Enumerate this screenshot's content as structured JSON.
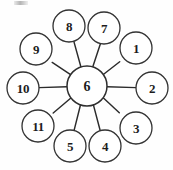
{
  "diagram": {
    "type": "wheel-graph",
    "title": "",
    "canvas": {
      "width": 173,
      "height": 170,
      "background": "#fefefe"
    },
    "colors": {
      "stroke": "#333333",
      "hub_stroke": "#2e2e2e",
      "spoke": "#2b2b2b",
      "node_fill": "#ffffff",
      "label": "#1d1d1d"
    },
    "hub": {
      "label": "6",
      "cx": 87,
      "cy": 86,
      "r": 20
    },
    "ring": {
      "radius": 58,
      "node_radius": 16,
      "count": 11
    },
    "nodes": [
      {
        "label": "1",
        "cx": 136,
        "cy": 48,
        "r": 16
      },
      {
        "label": "2",
        "cx": 152,
        "cy": 88,
        "r": 16
      },
      {
        "label": "3",
        "cx": 136,
        "cy": 128,
        "r": 16
      },
      {
        "label": "4",
        "cx": 105,
        "cy": 146,
        "r": 16
      },
      {
        "label": "5",
        "cx": 70,
        "cy": 146,
        "r": 16
      },
      {
        "label": "7",
        "cx": 104,
        "cy": 28,
        "r": 16
      },
      {
        "label": "8",
        "cx": 69,
        "cy": 26,
        "r": 16
      },
      {
        "label": "9",
        "cx": 36,
        "cy": 49,
        "r": 16
      },
      {
        "label": "10",
        "cx": 23,
        "cy": 88,
        "r": 16
      },
      {
        "label": "11",
        "cx": 38,
        "cy": 126,
        "r": 16
      }
    ],
    "edges": [
      {
        "from": "6",
        "to": "1"
      },
      {
        "from": "6",
        "to": "2"
      },
      {
        "from": "6",
        "to": "3"
      },
      {
        "from": "6",
        "to": "4"
      },
      {
        "from": "6",
        "to": "5"
      },
      {
        "from": "6",
        "to": "7"
      },
      {
        "from": "6",
        "to": "8"
      },
      {
        "from": "6",
        "to": "9"
      },
      {
        "from": "6",
        "to": "10"
      },
      {
        "from": "6",
        "to": "11"
      }
    ],
    "artifact": {
      "name": "scan-smudge",
      "visible": true
    }
  }
}
